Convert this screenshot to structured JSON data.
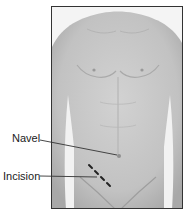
{
  "diagram": {
    "labels": [
      {
        "id": "navel",
        "text": "Navel",
        "target": "navel point"
      },
      {
        "id": "incision",
        "text": "Incision",
        "target": "dashed incision line lower right abdomen"
      }
    ]
  },
  "colors": {
    "skin": "#c4c4c4",
    "frame": "#333333",
    "background": "#ffffff",
    "text": "#222222"
  }
}
